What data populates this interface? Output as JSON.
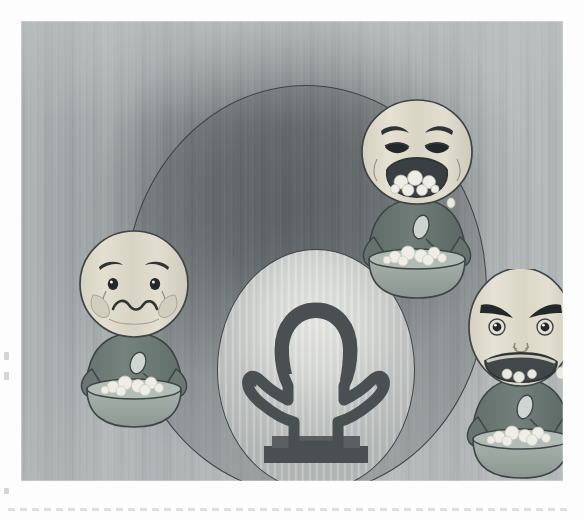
{
  "illustration": {
    "title": "Children with different emotional reactions at mealtime",
    "medium": "grayscale cartoon illustration",
    "alt_text": "Three cartoon children holding bowls of food show sad, crying and angry faces arranged around a central glowing oval containing the dark silhouette of an adult standing with hands on hips behind a table.",
    "canvas": {
      "width": 583,
      "height": 519,
      "plate_left": 21,
      "plate_top": 21,
      "plate_width": 542,
      "plate_height": 460
    },
    "palette": {
      "paper": "#fdfdfd",
      "background_gray": "#b0b5b6",
      "vignette_dark": "#3c4244",
      "outline": "#3f4446",
      "face_skin": "#dedacb",
      "face_shadow": "#c3bfae",
      "shirt": "#6f7b79",
      "shirt_shadow": "#5c6866",
      "bowl": "#9aa6a1",
      "bowl_rim": "#aab5b0",
      "food_white": "#eeeee6",
      "silhouette": "#4a5052",
      "oval_glow": "#e6e7e3",
      "tear": "#e9ecef"
    },
    "background": {
      "name": "dark mood cloud vignette",
      "texture": "vertical scan streaks",
      "big_circle": {
        "label": "large circular frame",
        "left": 104,
        "top": 64,
        "width": 360,
        "height": 408
      },
      "center_oval": {
        "label": "central glowing oval spotlight",
        "left": 196,
        "top": 228,
        "width": 196,
        "height": 240
      }
    },
    "center_figure": {
      "name": "adult silhouette",
      "description": "dark outlined silhouette of a long-haired adult standing with hands on hips behind a table",
      "fill": "#4a5052"
    },
    "characters": [
      {
        "id": "child-left",
        "position": "left",
        "emotion": "sad",
        "expression_label": "Sad",
        "mouth": "wavy frown",
        "eyebrows": "drooping",
        "has_tears": true,
        "holding": "bowl of food with spoon",
        "shirt_color": "#6f7b79",
        "face_color": "#dedacb",
        "left": 38,
        "top": 208,
        "width": 142,
        "height": 200
      },
      {
        "id": "child-top",
        "position": "top",
        "emotion": "crying",
        "expression_label": "Crying",
        "mouth": "wide open, mouth full of food",
        "eyebrows": "raised inner, worried",
        "has_tears": true,
        "holding": "bowl of food with spoon",
        "shirt_color": "#6f7b79",
        "face_color": "#dedacb",
        "left": 318,
        "top": 78,
        "width": 150,
        "height": 200
      },
      {
        "id": "child-right",
        "position": "right",
        "emotion": "angry",
        "expression_label": "Angry",
        "mouth": "wide open, gritted, food spilling",
        "eyebrows": "sharp downward V",
        "has_tears": false,
        "holding": "bowl of food with spoon",
        "shirt_color": "#6f7b79",
        "face_color": "#dedacb",
        "left": 420,
        "top": 248,
        "width": 152,
        "height": 208
      }
    ],
    "artifacts": {
      "scan_dashed_line": "faint dashed scanner line along the bottom edge",
      "edge_flecks": "small gray specks along the left margin"
    }
  }
}
